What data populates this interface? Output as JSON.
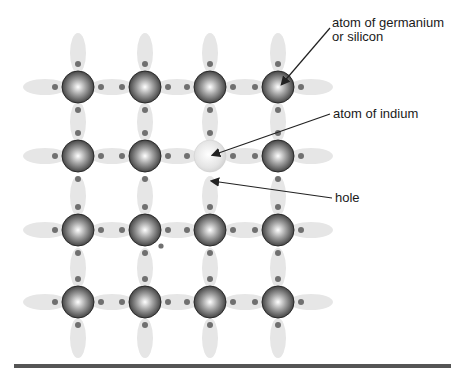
{
  "labels": {
    "germanium": "atom of germanium\nor silicon",
    "indium": "atom of indium",
    "hole": "hole"
  },
  "lattice": {
    "columns_x": [
      78,
      145,
      210,
      278
    ],
    "rows_y": [
      87,
      156,
      230,
      302
    ],
    "indium_position": {
      "col": 2,
      "row": 1
    },
    "hole_position": {
      "x": 207,
      "y": 185
    }
  },
  "colors": {
    "bond_cloud": "#e6e6e6",
    "electron": "#707070",
    "atom_dark": "#3a3a3a",
    "atom_light": "#f4f4f4",
    "indium_atom": "#e2e2e2",
    "leader_line": "#222222",
    "baseline": "#555555"
  }
}
